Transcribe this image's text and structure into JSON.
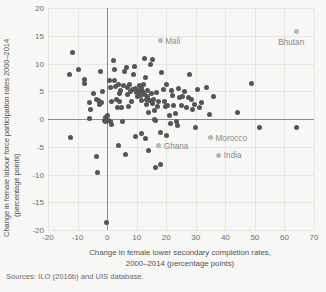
{
  "chart_data": {
    "type": "scatter",
    "title": "",
    "xlabel": "Change in female lower secondary completion rates, 2000–2014 (percentage points)",
    "xlabel_line1": "Change in female lower secondary completion rates,",
    "xlabel_line2": "2000–2014 (percentage points)",
    "ylabel": "Change in female labour force participation rates 2000–2014 (percentage points)",
    "ylabel_line1": "Change in female labour force participation rates 2000–2014",
    "ylabel_line2": "(percentage points)",
    "xlim": [
      -20,
      70
    ],
    "ylim": [
      -20,
      20
    ],
    "xticks": [
      -20,
      -10,
      0,
      10,
      20,
      30,
      40,
      50,
      60,
      70
    ],
    "yticks": [
      20,
      15,
      10,
      5,
      0,
      -5,
      -10,
      -15,
      -20
    ],
    "xticklabels": [
      "-20",
      "-10",
      "0",
      "10",
      "20",
      "30",
      "40",
      "50",
      "60",
      "70"
    ],
    "yticklabels": [
      "20",
      "15",
      "10",
      "5",
      "0",
      "-5",
      "-10",
      "-15",
      "-20"
    ],
    "grid": true,
    "legend": "none",
    "zero_lines": {
      "x": 0,
      "y": 0
    },
    "marker_color": "#555555",
    "highlight_color": "#b6b6b4",
    "grid_color": "#e6e6e2",
    "axis_color": "#8c8c8c",
    "background": "#f7f7f5",
    "annotations": [
      {
        "label": "Mali",
        "x": 18.0,
        "y": 14.1,
        "dx": 5,
        "dy": 0
      },
      {
        "label": "Bhutan",
        "x": 64.0,
        "y": 15.7,
        "dx": -1,
        "dy": 12
      },
      {
        "label": "Morocco",
        "x": 35.0,
        "y": -3.4,
        "dx": 5,
        "dy": 0
      },
      {
        "label": "India",
        "x": 37.8,
        "y": -6.5,
        "dx": 5,
        "dy": 0
      },
      {
        "label": "Ghana",
        "x": 17.5,
        "y": -4.8,
        "dx": 5,
        "dy": 0
      }
    ],
    "points": [
      [
        -11.8,
        11.9
      ],
      [
        -12.7,
        8.1
      ],
      [
        -9.7,
        8.9
      ],
      [
        -7.8,
        7.2
      ],
      [
        -7.6,
        6.4
      ],
      [
        -6.0,
        3.0
      ],
      [
        -5.6,
        1.8
      ],
      [
        -5.8,
        0.1
      ],
      [
        -3.5,
        3.5
      ],
      [
        -3.0,
        3.3
      ],
      [
        -2.6,
        2.6
      ],
      [
        -2.1,
        8.5
      ],
      [
        -1.9,
        3.0
      ],
      [
        -1.0,
        -0.2
      ],
      [
        -0.6,
        0.2
      ],
      [
        -0.5,
        -0.4
      ],
      [
        -3.2,
        -9.7
      ],
      [
        -3.5,
        -6.7
      ],
      [
        -12.5,
        -3.4
      ],
      [
        -0.3,
        -18.7
      ],
      [
        0.3,
        0.6
      ],
      [
        0.4,
        -0.3
      ],
      [
        1.3,
        -0.5
      ],
      [
        1.5,
        3.1
      ],
      [
        1.0,
        5.6
      ],
      [
        0.8,
        7.0
      ],
      [
        2.1,
        10.5
      ],
      [
        2.4,
        9.0
      ],
      [
        2.6,
        7.0
      ],
      [
        3.0,
        5.8
      ],
      [
        3.2,
        3.6
      ],
      [
        3.5,
        2.1
      ],
      [
        4.0,
        6.2
      ],
      [
        4.2,
        4.6
      ],
      [
        4.5,
        5.2
      ],
      [
        4.3,
        3.2
      ],
      [
        5.0,
        2.1
      ],
      [
        5.2,
        -0.4
      ],
      [
        5.5,
        6.0
      ],
      [
        6.0,
        8.6
      ],
      [
        6.5,
        9.3
      ],
      [
        6.8,
        5.6
      ],
      [
        7.0,
        4.4
      ],
      [
        7.2,
        2.3
      ],
      [
        7.6,
        6.2
      ],
      [
        8.0,
        5.0
      ],
      [
        8.2,
        3.2
      ],
      [
        8.5,
        5.4
      ],
      [
        9.0,
        8.0
      ],
      [
        9.3,
        9.5
      ],
      [
        9.6,
        5.5
      ],
      [
        10.0,
        4.8
      ],
      [
        10.2,
        4.0
      ],
      [
        10.5,
        5.0
      ],
      [
        10.8,
        6.0
      ],
      [
        11.0,
        5.2
      ],
      [
        11.2,
        4.2
      ],
      [
        11.5,
        5.5
      ],
      [
        11.8,
        3.4
      ],
      [
        12.0,
        5.0
      ],
      [
        12.2,
        6.3
      ],
      [
        12.5,
        4.4
      ],
      [
        12.8,
        10.9
      ],
      [
        13.0,
        7.4
      ],
      [
        13.2,
        2.6
      ],
      [
        13.4,
        3.6
      ],
      [
        13.6,
        5.2
      ],
      [
        13.8,
        4.0
      ],
      [
        14.0,
        1.2
      ],
      [
        14.4,
        3.3
      ],
      [
        14.8,
        9.8
      ],
      [
        15.2,
        10.7
      ],
      [
        15.0,
        4.6
      ],
      [
        15.4,
        2.8
      ],
      [
        15.8,
        3.6
      ],
      [
        16.0,
        1.6
      ],
      [
        16.2,
        0.0
      ],
      [
        16.5,
        -0.3
      ],
      [
        16.8,
        4.8
      ],
      [
        17.0,
        2.2
      ],
      [
        17.5,
        3.1
      ],
      [
        18.0,
        -2.5
      ],
      [
        18.5,
        8.4
      ],
      [
        19.0,
        5.4
      ],
      [
        19.4,
        3.2
      ],
      [
        19.8,
        2.3
      ],
      [
        20.2,
        6.2
      ],
      [
        20.6,
        2.4
      ],
      [
        21.0,
        0.6
      ],
      [
        21.4,
        -0.8
      ],
      [
        21.8,
        5.2
      ],
      [
        22.2,
        4.2
      ],
      [
        22.6,
        2.4
      ],
      [
        23.0,
        1.0
      ],
      [
        23.4,
        -0.4
      ],
      [
        23.8,
        -1.2
      ],
      [
        24.2,
        5.5
      ],
      [
        24.6,
        3.8
      ],
      [
        25.0,
        2.5
      ],
      [
        25.6,
        4.0
      ],
      [
        26.2,
        5.0
      ],
      [
        26.8,
        2.0
      ],
      [
        27.4,
        3.8
      ],
      [
        28.0,
        8.0
      ],
      [
        28.5,
        3.5
      ],
      [
        29.0,
        1.8
      ],
      [
        29.5,
        2.6
      ],
      [
        30.0,
        -1.6
      ],
      [
        30.5,
        5.3
      ],
      [
        31.2,
        2.0
      ],
      [
        32.0,
        3.0
      ],
      [
        33.5,
        5.7
      ],
      [
        34.5,
        0.8
      ],
      [
        36.0,
        4.0
      ],
      [
        44.0,
        1.2
      ],
      [
        49.0,
        6.4
      ],
      [
        51.5,
        -1.5
      ],
      [
        64.0,
        -1.5
      ],
      [
        3.8,
        -4.7
      ],
      [
        6.2,
        -6.4
      ],
      [
        9.6,
        -3.2
      ],
      [
        11.5,
        -2.6
      ],
      [
        14.0,
        -5.7
      ],
      [
        16.5,
        -8.7
      ],
      [
        18.2,
        -8.2
      ],
      [
        13.0,
        -3.5
      ],
      [
        20.0,
        -3.0
      ],
      [
        1.5,
        -1.0
      ],
      [
        -1.5,
        5.0
      ],
      [
        -4.5,
        4.6
      ]
    ]
  }
}
